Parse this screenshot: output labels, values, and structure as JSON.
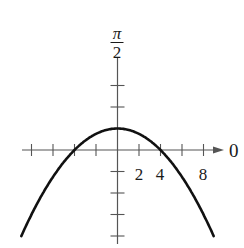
{
  "figure": {
    "corner_label": ")",
    "angle_labels": {
      "vertical_numerator": "π",
      "vertical_denominator": "2",
      "horizontal": "0"
    },
    "tick_labels": [
      {
        "text": "2",
        "value": 2
      },
      {
        "text": "4",
        "value": 4
      },
      {
        "text": "8",
        "value": 8
      }
    ],
    "colors": {
      "axis": "#555555",
      "curve": "#111111",
      "text": "#1a1a1a"
    }
  },
  "chart_data": {
    "type": "line",
    "title": "",
    "plot_kind": "polar",
    "equation": "r = 4/(1 + sin θ)",
    "axes": {
      "polar_axis_label": "0",
      "vertical_axis_label": "π/2",
      "tick_spacing": 2,
      "x_ticks": [
        -8,
        -6,
        -4,
        -2,
        0,
        2,
        4,
        6,
        8
      ],
      "x_tick_labels_shown": [
        "2",
        "4",
        "8"
      ],
      "y_ticks": [
        6,
        4,
        2,
        -2,
        -4,
        -6,
        -8
      ],
      "xlim": [
        -9.5,
        10
      ],
      "ylim": [
        -9,
        8
      ]
    },
    "series": [
      {
        "name": "parabola",
        "x": [
          -8.9,
          -8,
          -6,
          -4,
          -2,
          0,
          2,
          4,
          6,
          8,
          8.9
        ],
        "y": [
          -7.9,
          -6,
          -2.5,
          0,
          1.5,
          2,
          1.5,
          0,
          -2.5,
          -6,
          -7.9
        ]
      }
    ],
    "key_points": {
      "vertex": [
        0,
        2
      ],
      "x_intercepts": [
        -4,
        4
      ]
    },
    "grid": false,
    "legend": null
  }
}
